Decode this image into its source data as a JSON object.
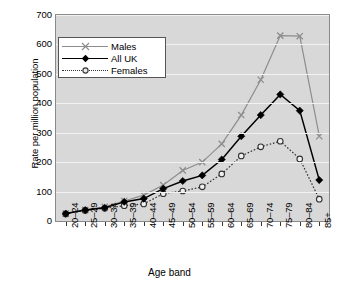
{
  "chart_data": {
    "type": "line",
    "title": "",
    "xlabel": "Age band",
    "ylabel": "Rate per million population",
    "categories": [
      "20–24",
      "25–29",
      "30–34",
      "35–39",
      "40–44",
      "45–49",
      "50–54",
      "55–59",
      "60–64",
      "65–69",
      "70–74",
      "75–79",
      "80–84",
      "85+"
    ],
    "ylim": [
      0,
      700
    ],
    "yticks": [
      0,
      100,
      200,
      300,
      400,
      500,
      600,
      700
    ],
    "grid": true,
    "legend_position": "top-left",
    "series": [
      {
        "name": "Males",
        "color": "#8d8d8d",
        "marker": "x",
        "linestyle": "solid",
        "values": [
          25,
          38,
          48,
          68,
          88,
          122,
          172,
          200,
          262,
          360,
          480,
          630,
          628,
          288
        ]
      },
      {
        "name": "All UK",
        "color": "#000000",
        "marker": "filled-diamond",
        "linestyle": "solid",
        "values": [
          25,
          37,
          45,
          65,
          76,
          110,
          136,
          155,
          209,
          288,
          360,
          430,
          375,
          139
        ]
      },
      {
        "name": "Females",
        "color": "#333333",
        "marker": "open-circle",
        "linestyle": "dotted",
        "values": [
          24,
          36,
          43,
          52,
          58,
          93,
          102,
          116,
          160,
          221,
          252,
          271,
          211,
          74
        ]
      }
    ]
  },
  "axes": {
    "y_tick_labels": [
      "700",
      "600",
      "500",
      "400",
      "300",
      "200",
      "100",
      "0"
    ],
    "y_title": "Rate per million population",
    "x_title": "Age band"
  },
  "legend": {
    "entries": [
      {
        "label": "Males",
        "marker": "x-marker",
        "style": "solid-gray"
      },
      {
        "label": "All UK",
        "marker": "diamond-marker",
        "style": "solid-black"
      },
      {
        "label": "Females",
        "marker": "circle-marker",
        "style": "dotted-black"
      }
    ]
  },
  "style": {
    "plot_background": "#d8d8d8",
    "gridline_color": "#f2f2f2",
    "frame_color": "#8a8a8a",
    "page_background": "#ffffff"
  }
}
